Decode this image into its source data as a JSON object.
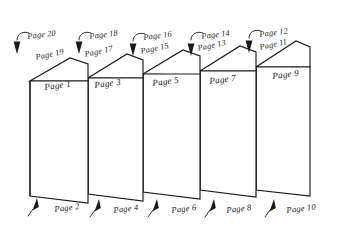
{
  "figure": {
    "type": "line-drawing",
    "sheet_count": 5,
    "stroke_color": "#1a1a1a",
    "fill_color": "#ffffff"
  },
  "sheets": [
    {
      "id": "sheet-1",
      "front_label": "Page 1",
      "top_edge_label": "Page 19",
      "callout_top_label": "Page 20",
      "callout_bottom_label": "Page 2"
    },
    {
      "id": "sheet-2",
      "front_label": "Page 3",
      "top_edge_label": "Page 17",
      "callout_top_label": "Page 18",
      "callout_bottom_label": "Page 4"
    },
    {
      "id": "sheet-3",
      "front_label": "Page 5",
      "top_edge_label": "Page 15",
      "callout_top_label": "Page 16",
      "callout_bottom_label": "Page 6"
    },
    {
      "id": "sheet-4",
      "front_label": "Page 7",
      "top_edge_label": "Page 13",
      "callout_top_label": "Page 14",
      "callout_bottom_label": "Page 8"
    },
    {
      "id": "sheet-5",
      "front_label": "Page 9",
      "top_edge_label": "Page 11",
      "callout_top_label": "Page 12",
      "callout_bottom_label": "Page 10"
    }
  ]
}
